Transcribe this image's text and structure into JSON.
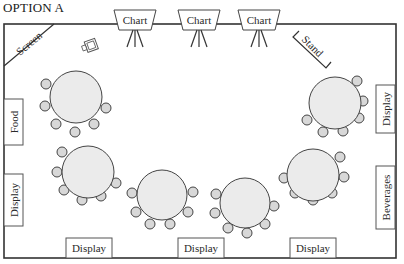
{
  "title": "OPTION A",
  "room": {
    "x": 4,
    "y": 24,
    "w": 392,
    "h": 234
  },
  "colors": {
    "wall": "#333333",
    "table_fill": "#ebebeb",
    "chair_fill": "#d8d8d8",
    "text": "#2a2a2a"
  },
  "screen": {
    "label": "Screen"
  },
  "stand": {
    "label": "Stand"
  },
  "projector": {
    "icon": "projector-icon"
  },
  "charts": [
    {
      "label": "Chart",
      "x": 135
    },
    {
      "label": "Chart",
      "x": 199
    },
    {
      "label": "Chart",
      "x": 259
    }
  ],
  "side_boxes": [
    {
      "label": "Food",
      "side": "left",
      "x": 4,
      "y": 99,
      "w": 19,
      "h": 46
    },
    {
      "label": "Display",
      "side": "left",
      "x": 4,
      "y": 174,
      "w": 19,
      "h": 52
    },
    {
      "label": "Display",
      "side": "right",
      "x": 376,
      "y": 85,
      "w": 19,
      "h": 48
    },
    {
      "label": "Beverages",
      "side": "right",
      "x": 376,
      "y": 166,
      "w": 19,
      "h": 63
    }
  ],
  "bottom_boxes": [
    {
      "label": "Display",
      "x": 66,
      "y": 238,
      "w": 46,
      "h": 20
    },
    {
      "label": "Display",
      "x": 178,
      "y": 238,
      "w": 46,
      "h": 20
    },
    {
      "label": "Display",
      "x": 290,
      "y": 238,
      "w": 46,
      "h": 20
    }
  ],
  "tables": [
    {
      "cx": 76,
      "cy": 97,
      "r": 26,
      "chairs": [
        [
          46,
          84
        ],
        [
          45,
          106
        ],
        [
          56,
          124
        ],
        [
          75,
          132
        ],
        [
          94,
          124
        ],
        [
          106,
          108
        ]
      ]
    },
    {
      "cx": 88,
      "cy": 172,
      "r": 26,
      "chairs": [
        [
          62,
          152
        ],
        [
          57,
          172
        ],
        [
          64,
          190
        ],
        [
          82,
          200
        ],
        [
          101,
          196
        ],
        [
          116,
          183
        ]
      ]
    },
    {
      "cx": 162,
      "cy": 195,
      "r": 25,
      "chairs": [
        [
          132,
          193
        ],
        [
          136,
          212
        ],
        [
          150,
          224
        ],
        [
          170,
          224
        ],
        [
          188,
          212
        ],
        [
          193,
          192
        ]
      ]
    },
    {
      "cx": 245,
      "cy": 203,
      "r": 25,
      "chairs": [
        [
          216,
          194
        ],
        [
          215,
          213
        ],
        [
          228,
          228
        ],
        [
          247,
          233
        ],
        [
          265,
          224
        ],
        [
          274,
          206
        ]
      ]
    },
    {
      "cx": 313,
      "cy": 175,
      "r": 26,
      "chairs": [
        [
          284,
          178
        ],
        [
          295,
          193
        ],
        [
          313,
          200
        ],
        [
          332,
          193
        ],
        [
          344,
          177
        ],
        [
          340,
          157
        ]
      ]
    },
    {
      "cx": 335,
      "cy": 103,
      "r": 26,
      "chairs": [
        [
          307,
          120
        ],
        [
          323,
          132
        ],
        [
          343,
          131
        ],
        [
          359,
          118
        ],
        [
          363,
          101
        ],
        [
          357,
          81
        ]
      ]
    }
  ]
}
